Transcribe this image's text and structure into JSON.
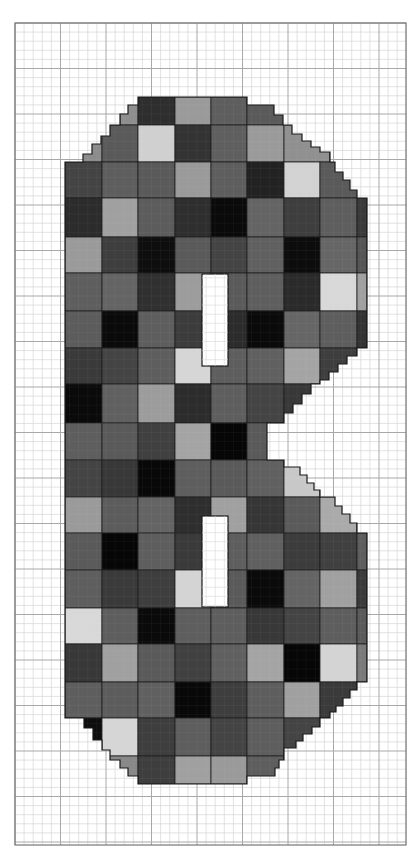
{
  "figure": {
    "type": "mosaic-pattern-chart",
    "grid": {
      "left": 15,
      "top": 23,
      "right": 406,
      "bottom": 845,
      "minor_step": 9.1,
      "major_every": 5,
      "minor_color": "#d6d6d6",
      "major_color": "#a8a8a8",
      "border_color": "#777777"
    },
    "tile_columns_x": [
      65,
      102,
      138,
      175,
      211,
      247,
      284,
      320,
      357,
      367
    ],
    "tile_rows_y": [
      97,
      125,
      162,
      198,
      237,
      273,
      311,
      348,
      384,
      423,
      460,
      497,
      533,
      570,
      608,
      644,
      682,
      718,
      756,
      784
    ],
    "outline_color": "#1a1a1a",
    "holes": [
      {
        "x": 202,
        "y": 274,
        "w": 26,
        "h": 92,
        "fill": "#ffffff"
      },
      {
        "x": 202,
        "y": 516,
        "w": 26,
        "h": 91,
        "fill": "#ffffff"
      }
    ],
    "shape_polygon": "138,97 247,97 247,105 274,105 274,115 283,115 283,125 292,125 292,134 302,134 302,141 311,141 311,147 320,147 320,152 330,152 330,162 335,162 335,172 343,172 343,180 350,180 350,190 357,190 357,198 367,198 367,348 357,348 357,356 347,356 347,364 338,364 338,372 329,372 329,380 320,380 320,384 311,384 311,394 302,394 302,404 293,404 293,413 284,413 284,423 267,423 267,460 284,460 284,467 300,467 300,475 307,475 307,483 314,483 314,490 320,490 320,497 335,497 335,506 342,506 342,514 350,514 350,523 357,523 357,533 367,533 367,682 357,682 357,690 350,690 350,698 343,698 343,706 336,706 336,712 330,712 330,718 320,718 320,727 312,727 312,734 303,734 303,741 296,741 296,748 284,748 284,756 284,760 279,760 279,768 275,768 275,776 247,776 247,784 138,784 138,776 128,776 128,768 120,768 120,760 110,760 110,750 102,750 102,740 93,740 93,728 84,728 84,718 65,718 65,162 83,162 83,154 92,154 92,144 101,144 101,136 110,136 110,125 120,125 120,114 128,114 128,105 138,105"
  },
  "tiles": [
    {
      "r": 0,
      "cells": [
        "#8e8e8e",
        "#2e2e2e",
        "#9a9a9a",
        "#5e5e5e",
        "#5a5a5a"
      ],
      "x": [
        120,
        138,
        175,
        211,
        247
      ],
      "w": [
        18,
        37,
        36,
        36,
        37
      ]
    },
    {
      "r": 1,
      "cells": [
        "#8c8c8c",
        "#5a5a5a",
        "#d0d0d0",
        "#333333",
        "#5f5f5f",
        "#9a9a9a",
        "#909090",
        "#4a4a4a"
      ],
      "x": [
        65,
        102,
        138,
        175,
        211,
        247,
        284,
        330
      ],
      "w": [
        37,
        36,
        37,
        36,
        36,
        37,
        46,
        10
      ]
    },
    {
      "r": 2,
      "cells": [
        "#444444",
        "#5e5e5e",
        "#5a5a5a",
        "#9a9a9a",
        "#5e5e5e",
        "#222222",
        "#d2d2d2",
        "#5a5a5a"
      ]
    },
    {
      "r": 3,
      "cells": [
        "#2c2c2c",
        "#a0a0a0",
        "#5c5c5c",
        "#2e2e2e",
        "#0a0a0a",
        "#646464",
        "#3e3e3e",
        "#5e5e5e",
        "#3a3a3a"
      ]
    },
    {
      "r": 4,
      "cells": [
        "#9a9a9a",
        "#3e3e3e",
        "#0e0e0e",
        "#5a5a5a",
        "#444444",
        "#606060",
        "#0c0c0c",
        "#666666",
        "#555555"
      ]
    },
    {
      "r": 5,
      "cells": [
        "#5e5e5e",
        "#646464",
        "#303030",
        "#9c9c9c",
        "#5a5a5a",
        "#5e5e5e",
        "#2a2a2a",
        "#d8d8d8",
        "#a0a0a0"
      ]
    },
    {
      "r": 6,
      "cells": [
        "#5c5c5c",
        "#0a0a0a",
        "#5e5e5e",
        "#3c3c3c",
        "#2c2c2c",
        "#0a0a0a",
        "#666666",
        "#5e5e5e",
        "#333333"
      ]
    },
    {
      "r": 7,
      "cells": [
        "#3a3a3a",
        "#444444",
        "#5e5e5e",
        "#d6d6d6",
        "#5e5e5e",
        "#606060",
        "#a4a4a4",
        "#3e3e3e",
        "#3e3e3e"
      ]
    },
    {
      "r": 8,
      "cells": [
        "#0a0a0a",
        "#606060",
        "#9c9c9c",
        "#2c2c2c",
        "#5e5e5e",
        "#444444",
        "#383838",
        "#383838",
        "#383838"
      ]
    },
    {
      "r": 9,
      "cells": [
        "#5e5e5e",
        "#5a5a5a",
        "#404040",
        "#a4a4a4",
        "#060606",
        "#5a5a5a",
        "#5a5a5a",
        "#5a5a5a",
        "#5a5a5a"
      ]
    },
    {
      "r": 10,
      "cells": [
        "#444444",
        "#383838",
        "#080808",
        "#5e5e5e",
        "#5a5a5a",
        "#606060",
        "#c8c8c8",
        "#c8c8c8",
        "#c8c8c8"
      ]
    },
    {
      "r": 11,
      "cells": [
        "#9a9a9a",
        "#5c5c5c",
        "#646464",
        "#2e2e2e",
        "#a0a0a0",
        "#363636",
        "#5a5a5a",
        "#aaaaaa",
        "#aaaaaa"
      ]
    },
    {
      "r": 12,
      "cells": [
        "#5a5a5a",
        "#060606",
        "#5e5e5e",
        "#3a3a3a",
        "#5e5e5e",
        "#606060",
        "#3c3c3c",
        "#404040",
        "#5e5e5e"
      ]
    },
    {
      "r": 13,
      "cells": [
        "#5e5e5e",
        "#3a3a3a",
        "#3e3e3e",
        "#d4d4d4",
        "#5a5a5a",
        "#0a0a0a",
        "#646464",
        "#a0a0a0",
        "#3a3a3a"
      ]
    },
    {
      "r": 14,
      "cells": [
        "#d8d8d8",
        "#5e5e5e",
        "#0a0a0a",
        "#5e5e5e",
        "#5e5e5e",
        "#383838",
        "#444444",
        "#5e5e5e",
        "#5a5a5a"
      ]
    },
    {
      "r": 15,
      "cells": [
        "#383838",
        "#a0a0a0",
        "#5a5a5a",
        "#404040",
        "#606060",
        "#a4a4a4",
        "#060606",
        "#d4d4d4",
        "#7a7a7a"
      ]
    },
    {
      "r": 16,
      "cells": [
        "#5e5e5e",
        "#5c5c5c",
        "#606060",
        "#080808",
        "#3e3e3e",
        "#5e5e5e",
        "#a0a0a0",
        "#3a3a3a",
        "#3a3a3a"
      ]
    },
    {
      "r": 17,
      "cells": [
        "#0e0e0e",
        "#d6d6d6",
        "#3e3e3e",
        "#5e5e5e",
        "#444444",
        "#5e5e5e",
        "#444444",
        "#444444",
        "#444444"
      ]
    },
    {
      "r": 18,
      "cells": [
        "#888888",
        "#888888",
        "#3e3e3e",
        "#a0a0a0",
        "#9a9a9a",
        "#5e5e5e",
        "#5e5e5e",
        "#5e5e5e",
        "#5e5e5e"
      ]
    }
  ]
}
